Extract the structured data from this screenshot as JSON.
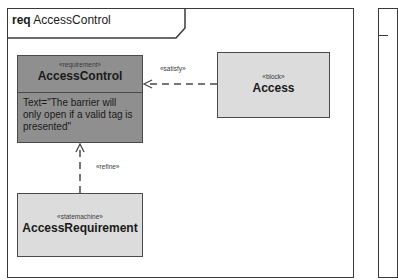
{
  "diagram": {
    "frame": {
      "kind": "req",
      "name": "AccessControl"
    },
    "nodes": [
      {
        "id": "access-control",
        "stereotype": "«requirement»",
        "name": "AccessControl",
        "text": "Text=\"The barrier will only open if a valid tag is presented\"",
        "fill": "#8f8f8f"
      },
      {
        "id": "access",
        "stereotype": "«block»",
        "name": "Access",
        "fill": "#dcdcdc"
      },
      {
        "id": "access-requirement",
        "stereotype": "«statemachine»",
        "name": "AccessRequirement",
        "fill": "#dcdcdc"
      }
    ],
    "edges": [
      {
        "from": "access",
        "to": "access-control",
        "label": "«satisfy»",
        "style": "dashed-open-arrow"
      },
      {
        "from": "access-requirement",
        "to": "access-control",
        "label": "«refine»",
        "style": "dashed-open-arrow"
      }
    ]
  }
}
